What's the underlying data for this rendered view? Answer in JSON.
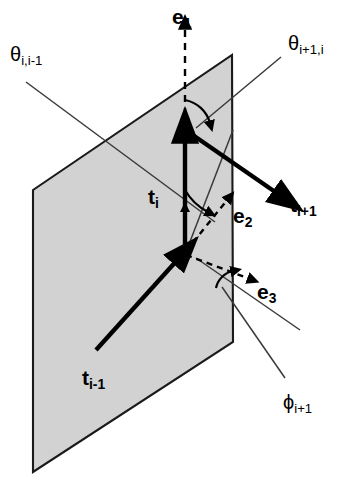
{
  "figure": {
    "type": "vector-geometry-diagram",
    "background_color": "#ffffff",
    "plane_fill_color": "#d2d2d2",
    "plane_stroke_color": "#1a1a1a",
    "vector_color": "#000000",
    "thin_line_color": "#3a3a3a"
  },
  "labels": {
    "theta_i_im1": {
      "base": "θ",
      "sub": "i,i-1"
    },
    "theta_ip1_i": {
      "base": "θ",
      "sub": "i+1,i"
    },
    "phi_ip1": {
      "base": "ϕ",
      "sub": "i+1"
    },
    "e1": {
      "base": "e",
      "sub": "1"
    },
    "e2": {
      "base": "e",
      "sub": "2"
    },
    "e3": {
      "base": "e",
      "sub": "3"
    },
    "t_im1": {
      "base": "t",
      "sub": "i-1"
    },
    "t_i": {
      "base": "t",
      "sub": "i"
    },
    "t_ip1": {
      "base": "t",
      "sub": "i+1"
    }
  },
  "geometry": {
    "plane_corners": [
      [
        33,
        190
      ],
      [
        232,
        55
      ],
      [
        233,
        342
      ],
      [
        33,
        472
      ]
    ],
    "origin": [
      185,
      253
    ],
    "t_i_tip": [
      185,
      130
    ],
    "t_ip1_tip": [
      286,
      199
    ],
    "t_im1_tail": [
      96,
      350
    ],
    "e1_tip": [
      185,
      22
    ],
    "e2_tip": [
      230,
      196
    ],
    "e3_tip": [
      253,
      280
    ]
  }
}
